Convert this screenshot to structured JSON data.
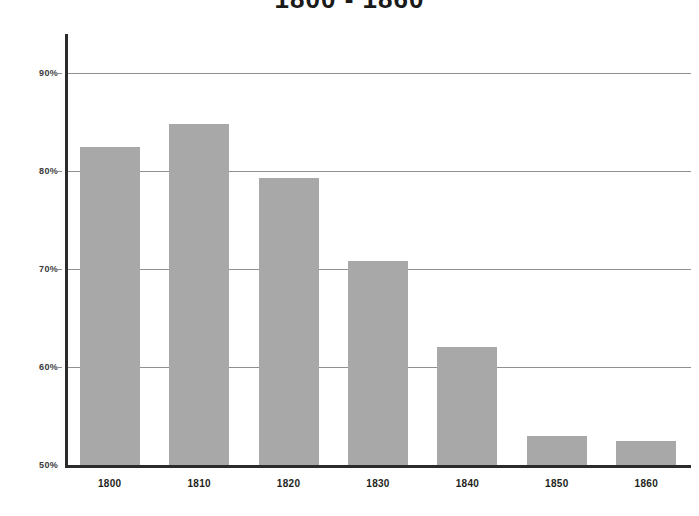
{
  "chart_data": {
    "type": "bar",
    "title": "1800 - 1860",
    "xlabel": "",
    "ylabel": "",
    "categories": [
      "1800",
      "1810",
      "1820",
      "1830",
      "1840",
      "1850",
      "1860"
    ],
    "values": [
      82.5,
      84.8,
      79.3,
      70.8,
      62.0,
      53.0,
      52.5
    ],
    "series": [
      {
        "name": "Percentage",
        "values": [
          82.5,
          84.8,
          79.3,
          70.8,
          62.0,
          53.0,
          52.5
        ]
      }
    ],
    "ylim": [
      50,
      94
    ],
    "yticks": [
      50,
      60,
      70,
      80,
      90
    ],
    "ytick_labels": [
      "50%",
      "60%",
      "70%",
      "80%",
      "90%"
    ],
    "grid": true,
    "gridlines_at": [
      60,
      70,
      80,
      90
    ],
    "legend": null,
    "bar_color": "#a8a8a8",
    "axis_color": "#2b2b2b",
    "grid_color": "#909090",
    "background": "#ffffff"
  }
}
